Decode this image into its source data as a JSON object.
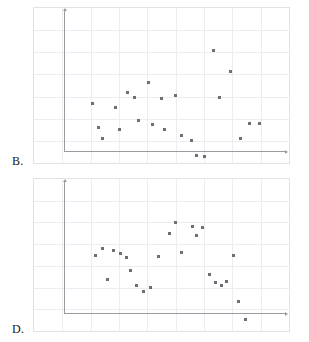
{
  "page": {
    "background": "#ffffff",
    "marker_color": "#6e6e76",
    "grid_color": "#ededf1",
    "axis_color": "#9a9aa2",
    "frame_color": "#e2e2e6"
  },
  "choices": [
    {
      "id": "B",
      "label": "B."
    },
    {
      "id": "D",
      "label": "D."
    }
  ],
  "chart_data": [
    {
      "type": "scatter",
      "title": "B.",
      "xlabel": "",
      "ylabel": "",
      "xlim": [
        0,
        9
      ],
      "ylim": [
        0,
        7
      ],
      "grid": true,
      "legend": "none",
      "x_gridlines": [
        1,
        2,
        3,
        4,
        5,
        6,
        7,
        8
      ],
      "y_gridlines": [
        1,
        2,
        3,
        4,
        5,
        6
      ],
      "series": [
        {
          "name": "points",
          "points": [
            [
              2.05,
              2.7
            ],
            [
              2.28,
              1.62
            ],
            [
              2.4,
              1.12
            ],
            [
              2.88,
              2.52
            ],
            [
              3.0,
              1.5
            ],
            [
              3.3,
              3.2
            ],
            [
              3.55,
              2.95
            ],
            [
              3.7,
              1.9
            ],
            [
              4.05,
              3.65
            ],
            [
              4.18,
              1.75
            ],
            [
              4.5,
              2.9
            ],
            [
              4.62,
              1.5
            ],
            [
              5.0,
              3.05
            ],
            [
              5.2,
              1.25
            ],
            [
              5.55,
              1.02
            ],
            [
              5.75,
              0.35
            ],
            [
              6.02,
              0.28
            ],
            [
              6.35,
              5.1
            ],
            [
              6.55,
              2.95
            ],
            [
              6.95,
              4.15
            ],
            [
              7.3,
              1.1
            ],
            [
              7.6,
              1.8
            ],
            [
              7.95,
              1.78
            ]
          ]
        }
      ]
    },
    {
      "type": "scatter",
      "title": "D.",
      "xlabel": "",
      "ylabel": "",
      "xlim": [
        0,
        9
      ],
      "ylim": [
        0,
        7
      ],
      "grid": true,
      "legend": "none",
      "x_gridlines": [
        1,
        2,
        3,
        4,
        5,
        6,
        7,
        8
      ],
      "y_gridlines": [
        1,
        2,
        3,
        4,
        5,
        6
      ],
      "series": [
        {
          "name": "points",
          "points": [
            [
              2.18,
              3.48
            ],
            [
              2.42,
              3.82
            ],
            [
              2.58,
              2.38
            ],
            [
              2.82,
              3.7
            ],
            [
              3.05,
              3.55
            ],
            [
              3.28,
              3.4
            ],
            [
              3.4,
              2.8
            ],
            [
              3.62,
              2.12
            ],
            [
              3.85,
              1.82
            ],
            [
              4.1,
              2.02
            ],
            [
              4.38,
              3.45
            ],
            [
              4.78,
              4.48
            ],
            [
              5.0,
              5.02
            ],
            [
              5.22,
              3.62
            ],
            [
              5.58,
              4.82
            ],
            [
              5.72,
              4.38
            ],
            [
              5.95,
              4.78
            ],
            [
              6.18,
              2.62
            ],
            [
              6.42,
              2.22
            ],
            [
              6.62,
              2.08
            ],
            [
              6.78,
              2.28
            ],
            [
              7.05,
              3.48
            ],
            [
              7.22,
              1.38
            ],
            [
              7.48,
              0.52
            ]
          ]
        }
      ]
    }
  ]
}
